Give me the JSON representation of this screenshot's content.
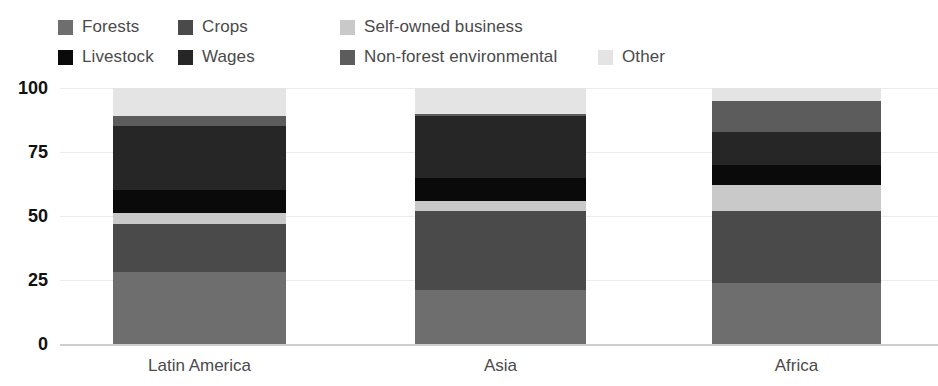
{
  "legend": {
    "rows": [
      [
        {
          "label": "Forests",
          "color": "#6e6e6e",
          "key": "forests"
        },
        {
          "label": "Crops",
          "color": "#4a4a4a",
          "key": "crops"
        },
        {
          "label": "Self-owned business",
          "color": "#c9c9c9",
          "key": "self-owned-business"
        }
      ],
      [
        {
          "label": "Livestock",
          "color": "#0a0a0a",
          "key": "livestock"
        },
        {
          "label": "Wages",
          "color": "#262626",
          "key": "wages"
        },
        {
          "label": "Non-forest environmental",
          "color": "#5c5c5c",
          "key": "non-forest-environmental"
        },
        {
          "label": "Other",
          "color": "#e4e4e4",
          "key": "other"
        }
      ]
    ]
  },
  "chart_data": {
    "type": "bar",
    "subtype": "stacked-bar-100",
    "title": "",
    "xlabel": "",
    "ylabel": "",
    "ylim": [
      0,
      100
    ],
    "yticks": [
      0,
      25,
      50,
      75,
      100
    ],
    "ytick_labels": [
      "0",
      "25",
      "50",
      "75",
      "100"
    ],
    "grid": true,
    "legend_position": "top",
    "categories": [
      "Latin America",
      "Asia",
      "Africa"
    ],
    "series": [
      {
        "name": "Forests",
        "color": "#6e6e6e",
        "values": [
          28,
          21,
          24
        ]
      },
      {
        "name": "Crops",
        "color": "#4a4a4a",
        "values": [
          19,
          31,
          28
        ]
      },
      {
        "name": "Self-owned business",
        "color": "#c9c9c9",
        "values": [
          4,
          4,
          10
        ]
      },
      {
        "name": "Livestock",
        "color": "#0a0a0a",
        "values": [
          9,
          9,
          8
        ]
      },
      {
        "name": "Wages",
        "color": "#262626",
        "values": [
          25,
          24,
          13
        ]
      },
      {
        "name": "Non-forest environmental",
        "color": "#5c5c5c",
        "values": [
          4,
          1,
          12
        ]
      },
      {
        "name": "Other",
        "color": "#e4e4e4",
        "values": [
          11,
          10,
          5
        ]
      }
    ]
  }
}
